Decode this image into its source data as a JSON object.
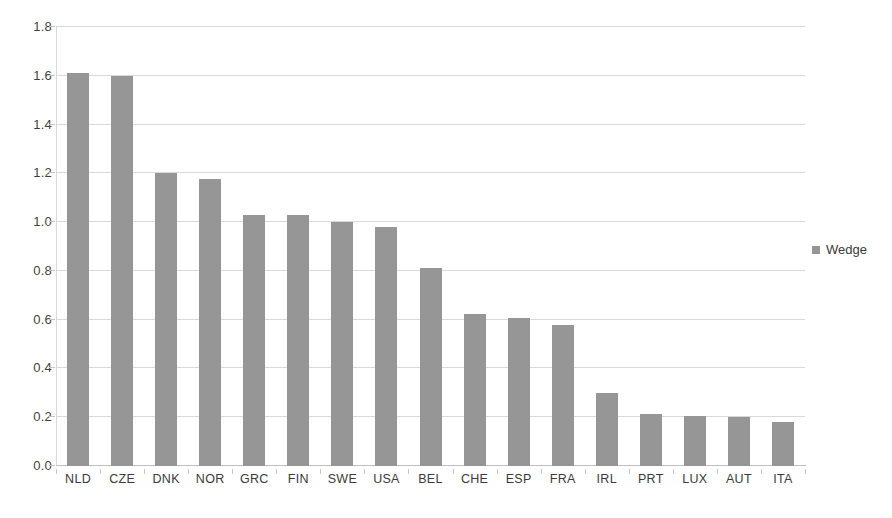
{
  "chart_data": {
    "type": "bar",
    "title": "",
    "subtitle": "",
    "xlabel": "",
    "ylabel": "",
    "ylim": [
      0.0,
      1.8
    ],
    "ytick_step": 0.2,
    "grid": true,
    "grid_axis": "y",
    "legend_position": "right",
    "categories": [
      "NLD",
      "CZE",
      "DNK",
      "NOR",
      "GRC",
      "FIN",
      "SWE",
      "USA",
      "BEL",
      "CHE",
      "ESP",
      "FRA",
      "IRL",
      "PRT",
      "LUX",
      "AUT",
      "ITA"
    ],
    "ytick_labels": [
      "1.8",
      "1.6",
      "1.4",
      "1.2",
      "1.0",
      "0.8",
      "0.6",
      "0.4",
      "0.2",
      "0.0"
    ],
    "ytick_values": [
      1.8,
      1.6,
      1.4,
      1.2,
      1.0,
      0.8,
      0.6,
      0.4,
      0.2,
      0.0
    ],
    "series": [
      {
        "name": "Wedge",
        "color": "#969696",
        "values": [
          1.61,
          1.6,
          1.2,
          1.175,
          1.03,
          1.03,
          1.0,
          0.98,
          0.81,
          0.625,
          0.605,
          0.578,
          0.3,
          0.215,
          0.207,
          0.203,
          0.18
        ]
      }
    ]
  },
  "legend": {
    "entries": [
      {
        "label": "Wedge",
        "color": "#969696",
        "marker": "square-marker"
      }
    ]
  },
  "colors": {
    "bar": "#969696",
    "gridline": "#d9d9d9",
    "axis": "#bfbfbf",
    "text": "#3a3a3a",
    "background": "#ffffff"
  }
}
